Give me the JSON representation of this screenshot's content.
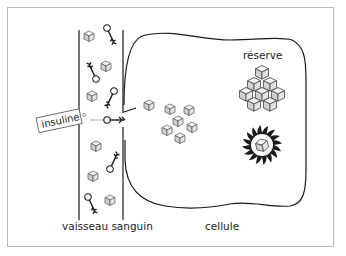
{
  "diagram": {
    "labels": {
      "vessel": "vaisseau sanguin",
      "cell": "cellule",
      "reserve": "réserve",
      "insulin": "insuline"
    },
    "colors": {
      "ink": "#1a1a1a",
      "cube_face": "#d8d8d8",
      "cube_top": "#f4f4f4",
      "frame": "#b8b8b8"
    }
  }
}
